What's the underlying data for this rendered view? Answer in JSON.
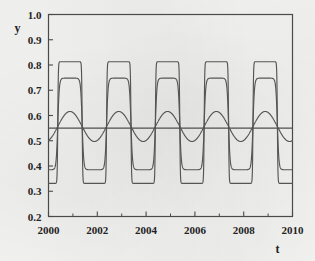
{
  "chart_data": {
    "type": "line",
    "title": "",
    "xlabel": "t",
    "ylabel": "y",
    "xlim": [
      2000,
      2010
    ],
    "ylim": [
      0.2,
      1.0
    ],
    "grid": false,
    "legend": "none",
    "xticks": [
      2000,
      2002,
      2004,
      2006,
      2008,
      2010
    ],
    "xtick_labels": [
      "2000",
      "2002",
      "2004",
      "2006",
      "2008",
      "2010"
    ],
    "xminor_ticks": [
      2001,
      2003,
      2005,
      2007,
      2009
    ],
    "yticks": [
      0.2,
      0.3,
      0.4,
      0.5,
      0.6,
      0.7,
      0.8,
      0.9,
      1.0
    ],
    "ytick_labels": [
      "0.2",
      "0.3",
      "0.4",
      "0.5",
      "0.6",
      "0.7",
      "0.8",
      "0.9",
      "1.0"
    ],
    "annotations": [
      {
        "name": "reference-line",
        "type": "hline",
        "y": 0.55,
        "label": ""
      }
    ],
    "series": [
      {
        "name": "outer-square-wave",
        "waveform": "square",
        "period_years": 2.0,
        "peak": 0.813,
        "trough": 0.331,
        "mean": 0.572,
        "sharpness": 14,
        "phase_years": 0.38
      },
      {
        "name": "middle-rounded-wave",
        "waveform": "rounded-square",
        "period_years": 2.0,
        "peak": 0.748,
        "trough": 0.385,
        "mean": 0.566,
        "sharpness": 5,
        "phase_years": 0.38
      },
      {
        "name": "inner-sine-wave",
        "waveform": "sine",
        "period_years": 2.0,
        "peak": 0.616,
        "trough": 0.497,
        "mean": 0.556,
        "sharpness": 1,
        "phase_years": 0.38
      }
    ]
  }
}
